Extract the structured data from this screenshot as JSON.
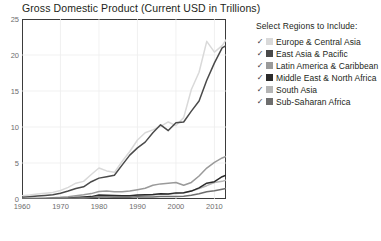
{
  "header": {
    "title": "Gross Domestic Product (Current USD in Trillions)"
  },
  "legend": {
    "title": "Select Regions to Include:",
    "check_glyph": "✓",
    "items": [
      {
        "label": "Europe & Central Asia",
        "color": "#d9d9d9",
        "checked": true
      },
      {
        "label": "East Asia & Pacific",
        "color": "#4a4a4a",
        "checked": true
      },
      {
        "label": "Latin America & Caribbean",
        "color": "#9a9a9a",
        "checked": true
      },
      {
        "label": "Middle East & North Africa",
        "color": "#2b2b2b",
        "checked": true
      },
      {
        "label": "South Asia",
        "color": "#b5b5b5",
        "checked": true
      },
      {
        "label": "Sub-Saharan Africa",
        "color": "#6e6e6e",
        "checked": true
      }
    ]
  },
  "chart_data": {
    "type": "line",
    "title": "Gross Domestic Product (Current USD in Trillions)",
    "xlabel": "",
    "ylabel": "",
    "xlim": [
      1960,
      2013
    ],
    "ylim": [
      0,
      25
    ],
    "yticks": [
      0,
      5,
      10,
      15,
      20,
      25
    ],
    "xticks": [
      1960,
      1970,
      1980,
      1990,
      2000,
      2010
    ],
    "grid": true,
    "legend_position": "right",
    "x": [
      1960,
      1962,
      1964,
      1966,
      1968,
      1970,
      1972,
      1974,
      1976,
      1978,
      1980,
      1982,
      1984,
      1986,
      1988,
      1990,
      1992,
      1994,
      1996,
      1998,
      2000,
      2002,
      2004,
      2006,
      2008,
      2010,
      2012,
      2013
    ],
    "series": [
      {
        "name": "Europe & Central Asia",
        "color": "#d9d9d9",
        "values": [
          0.46,
          0.55,
          0.68,
          0.8,
          0.92,
          1.18,
          1.62,
          2.2,
          2.45,
          3.4,
          4.3,
          3.9,
          3.7,
          5.2,
          6.6,
          8.2,
          9.2,
          9.6,
          10.1,
          10.7,
          10.2,
          11.3,
          15.2,
          17.6,
          21.9,
          20.4,
          21.3,
          22.1
        ]
      },
      {
        "name": "East Asia & Pacific",
        "color": "#4a4a4a",
        "values": [
          0.26,
          0.32,
          0.4,
          0.5,
          0.6,
          0.8,
          1.1,
          1.45,
          1.7,
          2.4,
          2.9,
          3.1,
          3.3,
          4.7,
          6.1,
          7.1,
          7.9,
          9.2,
          10.3,
          9.5,
          10.6,
          10.7,
          12.2,
          13.6,
          16.5,
          18.9,
          21.0,
          21.3
        ]
      },
      {
        "name": "Latin America & Caribbean",
        "color": "#9a9a9a",
        "values": [
          0.08,
          0.1,
          0.12,
          0.15,
          0.18,
          0.23,
          0.31,
          0.45,
          0.58,
          0.75,
          1.05,
          1.1,
          1.0,
          1.0,
          1.1,
          1.3,
          1.5,
          1.9,
          2.1,
          2.2,
          2.3,
          1.9,
          2.3,
          3.2,
          4.3,
          5.1,
          5.7,
          5.9
        ]
      },
      {
        "name": "South Asia",
        "color": "#b5b5b5",
        "values": [
          0.05,
          0.06,
          0.07,
          0.08,
          0.09,
          0.11,
          0.13,
          0.17,
          0.19,
          0.25,
          0.29,
          0.31,
          0.32,
          0.36,
          0.42,
          0.47,
          0.48,
          0.55,
          0.65,
          0.7,
          0.78,
          0.85,
          1.1,
          1.45,
          1.85,
          2.3,
          2.45,
          2.6
        ]
      },
      {
        "name": "Middle East & North Africa",
        "color": "#2b2b2b",
        "values": [
          0.02,
          0.03,
          0.04,
          0.05,
          0.06,
          0.08,
          0.11,
          0.22,
          0.28,
          0.33,
          0.55,
          0.52,
          0.5,
          0.44,
          0.45,
          0.55,
          0.6,
          0.62,
          0.72,
          0.7,
          0.85,
          0.88,
          1.1,
          1.55,
          2.2,
          2.4,
          3.1,
          3.3
        ]
      },
      {
        "name": "Sub-Saharan Africa",
        "color": "#6e6e6e",
        "values": [
          0.03,
          0.03,
          0.04,
          0.05,
          0.06,
          0.07,
          0.09,
          0.13,
          0.16,
          0.21,
          0.29,
          0.28,
          0.25,
          0.24,
          0.26,
          0.3,
          0.29,
          0.29,
          0.34,
          0.34,
          0.36,
          0.37,
          0.52,
          0.72,
          1.0,
          1.15,
          1.35,
          1.45
        ]
      }
    ]
  }
}
